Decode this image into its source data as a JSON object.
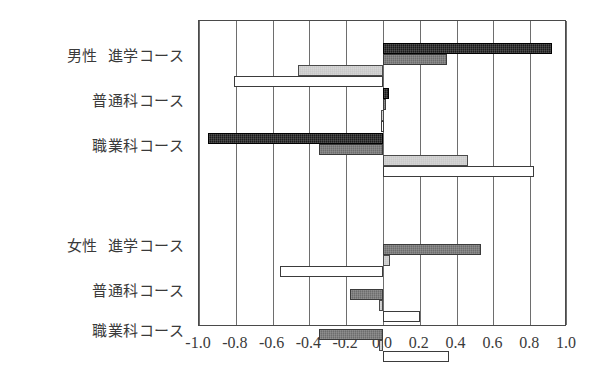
{
  "chart_data": {
    "type": "bar",
    "orientation": "horizontal",
    "title": "",
    "xlabel": "",
    "ylabel": "",
    "xlim": [
      -1.0,
      1.0
    ],
    "grid": true,
    "legend": "none",
    "xticks": [
      "-1.0",
      "-0.8",
      "-0.6",
      "-0.4",
      "-0.2",
      "0.0",
      "0.2",
      "0.4",
      "0.6",
      "0.8",
      "1.0"
    ],
    "xtick_values": [
      -1.0,
      -0.8,
      -0.6,
      -0.4,
      -0.2,
      0.0,
      0.2,
      0.4,
      0.6,
      0.8,
      1.0
    ],
    "groups": [
      {
        "group": "男性",
        "category": "進学コース"
      },
      {
        "group": "",
        "category": "普通科コース"
      },
      {
        "group": "",
        "category": "職業科コース"
      },
      {
        "group": "女性",
        "category": "進学コース"
      },
      {
        "group": "",
        "category": "普通科コース"
      },
      {
        "group": "",
        "category": "職業科コース"
      }
    ],
    "categories": [
      "男性 進学コース",
      "男性 普通科コース",
      "男性 職業科コース",
      "女性 進学コース",
      "女性 普通科コース",
      "女性 職業科コース"
    ],
    "series": [
      {
        "name": "series-1",
        "fill": "black",
        "color": "#1b1b1b",
        "values": [
          0.92,
          0.03,
          -0.95,
          0.0,
          0.0,
          0.0
        ]
      },
      {
        "name": "series-2",
        "fill": "dark-gray",
        "color": "#6d6d6d",
        "values": [
          0.35,
          0.01,
          -0.35,
          0.53,
          -0.18,
          -0.35
        ]
      },
      {
        "name": "series-3",
        "fill": "light-gray",
        "color": "#c9c9c9",
        "values": [
          -0.46,
          -0.01,
          0.46,
          0.04,
          -0.02,
          -0.02
        ]
      },
      {
        "name": "series-4",
        "fill": "white",
        "color": "#ffffff",
        "values": [
          -0.81,
          -0.01,
          0.82,
          -0.56,
          0.2,
          0.36
        ]
      }
    ]
  },
  "axis": {
    "y_labels": [
      {
        "group": "男性",
        "course": "進学コース"
      },
      {
        "group": "",
        "course": "普通科コース"
      },
      {
        "group": "",
        "course": "職業科コース"
      },
      {
        "group": "女性",
        "course": "進学コース"
      },
      {
        "group": "",
        "course": "普通科コース"
      },
      {
        "group": "",
        "course": "職業科コース"
      }
    ]
  }
}
